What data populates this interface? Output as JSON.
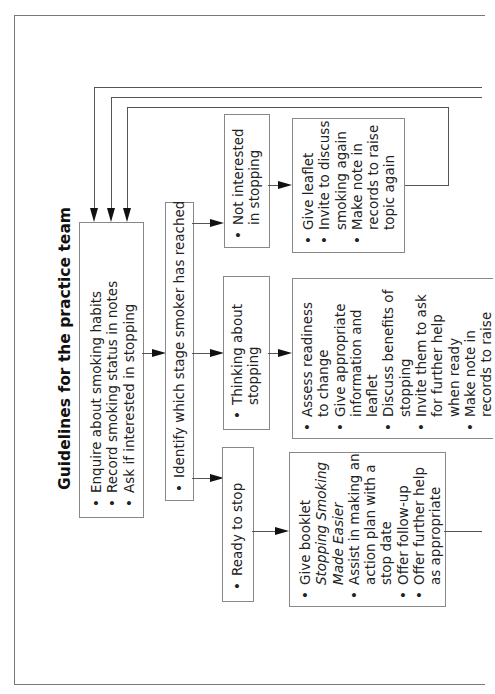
{
  "title": "Guidelines for the practice team",
  "boxes": {
    "initial": {
      "items": [
        "Enquire about smoking habits",
        "Record smoking status in notes",
        "Ask if interested in stopping"
      ]
    },
    "identify": {
      "items": [
        "Identify which stage smoker has reached"
      ]
    },
    "not_interested": {
      "items": [
        [
          "Not interested",
          "in stopping"
        ]
      ]
    },
    "thinking": {
      "items": [
        [
          "Thinking about",
          "stopping"
        ]
      ]
    },
    "ready": {
      "items": [
        "Ready to stop"
      ]
    },
    "not_interested_actions": {
      "items": [
        [
          "Give leaflet"
        ],
        [
          "Invite to discuss",
          "smoking again"
        ],
        [
          "Make note in",
          "records to raise",
          "topic again"
        ]
      ]
    },
    "thinking_actions": {
      "items": [
        [
          "Assess readiness",
          "to change"
        ],
        [
          "Give appropriate",
          "information and",
          "leaflet"
        ],
        [
          "Discuss benefits of",
          "stopping"
        ],
        [
          "Invite them to ask",
          "for further help",
          "when ready"
        ],
        [
          "Make note in",
          "records to raise"
        ]
      ]
    },
    "ready_actions": {
      "line1": "Give booklet",
      "booklet_title_1": "Stopping Smoking",
      "booklet_title_2": "Made Easier",
      "items": [
        [
          "Assist in making an",
          "action plan with a",
          "stop date"
        ],
        [
          "Offer follow-up"
        ],
        [
          "Offer further help",
          "as appropriate"
        ]
      ]
    }
  },
  "colors": {
    "border": "#888888",
    "line": "#555555",
    "arrow": "#111111",
    "text": "#222222"
  }
}
